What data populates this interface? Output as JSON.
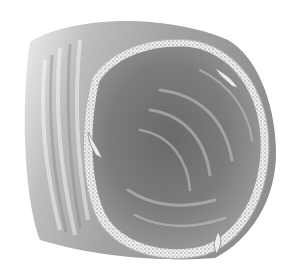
{
  "image": {
    "description": "Grayscale medical illustration of a tubular organ segment viewed obliquely, showing the outer wall and open lumen with a textured cut edge and small valve-like folds",
    "width": 281,
    "height": 270,
    "colors": {
      "background": "#ffffff",
      "outer_wall_light": "#d4d4d4",
      "outer_wall_dark": "#8c8c8c",
      "lumen_dark": "#6e6e6e",
      "lumen_mid": "#8a8a8a",
      "cut_edge": "#e6e6e6",
      "cut_edge_texture": "#9a9a9a"
    }
  }
}
